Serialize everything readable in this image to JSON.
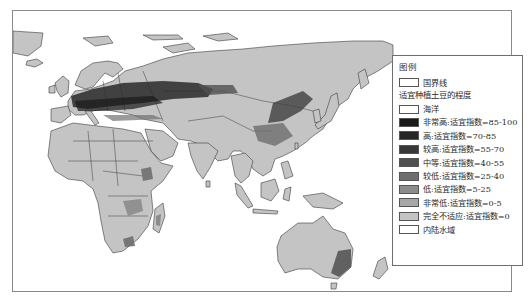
{
  "map": {
    "type": "choropleth",
    "subject": "适宜种植土豆的程度",
    "region": "Eastern Hemisphere (Europe, Africa, Asia, Oceania)",
    "high_suitability_areas": [
      "Central/Eastern Europe",
      "Western Russia",
      "Northeast China",
      "Ethiopian Highlands",
      "Southeast Australia",
      "South Africa highlands"
    ]
  },
  "legend": {
    "title": "图例",
    "boundary_item": {
      "label": "国界线",
      "color": "#ffffff"
    },
    "subtitle": "适宜种植土豆的程度",
    "items": [
      {
        "label": "海洋",
        "color": "#ffffff"
      },
      {
        "label": "非常高:适宜指数=85-100",
        "color": "#1a1a1a"
      },
      {
        "label": "高:适宜指数=70-85",
        "color": "#262626"
      },
      {
        "label": "较高:适宜指数=55-70",
        "color": "#383838"
      },
      {
        "label": "中等:适宜指数=40-55",
        "color": "#505050"
      },
      {
        "label": "较低:适宜指数=25-40",
        "color": "#6e6e6e"
      },
      {
        "label": "低:适宜指数=5-25",
        "color": "#8c8c8c"
      },
      {
        "label": "非常低:适宜指数=0-5",
        "color": "#a8a8a8"
      },
      {
        "label": "完全不适应:适宜指数=0",
        "color": "#c4c4c4"
      },
      {
        "label": "内陆水域",
        "color": "#ffffff"
      }
    ]
  },
  "colors": {
    "land_base": "#c4c4c4",
    "border": "#3a3a3a",
    "ocean": "#ffffff",
    "frame": "#8a8a8a"
  }
}
